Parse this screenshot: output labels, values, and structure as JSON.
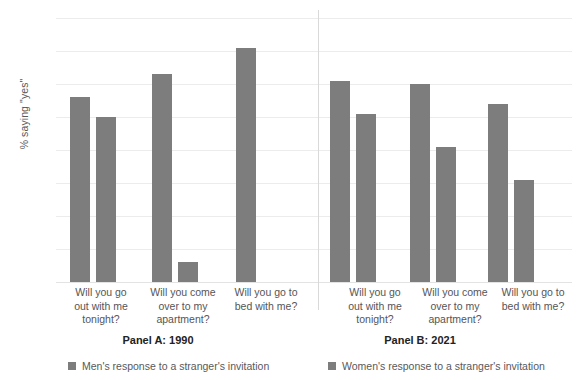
{
  "chart_data": {
    "type": "bar",
    "title": "",
    "subtitle": "",
    "xlabel": "",
    "ylabel": "% saying \"yes\"",
    "ylim": [
      0,
      80
    ],
    "ytick_labels": [
      "0",
      "10",
      "20",
      "30",
      "40",
      "50",
      "60",
      "70",
      "80"
    ],
    "ytick_values": [
      0,
      10,
      20,
      30,
      40,
      50,
      60,
      70,
      80
    ],
    "grid": true,
    "legend_position": "bottom",
    "categories": [
      "Will you go out with me tonight?",
      "Will you come over to my apartment?",
      "Will you go to bed with me?"
    ],
    "panels": [
      {
        "title": "Panel A: 1990",
        "series": [
          {
            "name": "Men's response to a stranger's invitation",
            "values": [
              56,
              63,
              71
            ]
          },
          {
            "name": "Women's response to a stranger's invitation",
            "values": [
              50,
              6,
              0
            ]
          }
        ]
      },
      {
        "title": "Panel B: 2021",
        "series": [
          {
            "name": "Men's response to a stranger's invitation",
            "values": [
              61,
              60,
              54
            ]
          },
          {
            "name": "Women's response to a stranger's invitation",
            "values": [
              51,
              41,
              31
            ]
          }
        ]
      }
    ],
    "colors": {
      "bar": "#7d7d7d",
      "gridline": "#ececed",
      "axis_text": "#59595b",
      "title_text": "#222224",
      "background": "#ffffff"
    }
  },
  "axis": {
    "y_title": "% saying \"yes\"",
    "ticks": [
      "80",
      "70",
      "60",
      "50",
      "40",
      "30",
      "20",
      "10",
      "0"
    ]
  },
  "category_labels": {
    "line_1_a": "Will you go",
    "line_1_b": "out with me",
    "line_1_c": "tonight?",
    "line_2_a": "Will you come",
    "line_2_b": "over to my",
    "line_2_c": "apartment?",
    "line_3_a": "Will you go to",
    "line_3_b": "bed with me?"
  },
  "panel_titles": {
    "a": "Panel A: 1990",
    "b": "Panel B: 2021"
  },
  "legend": {
    "men": "Men's response to a stranger's invitation",
    "women": "Women's response to a stranger's invitation"
  }
}
